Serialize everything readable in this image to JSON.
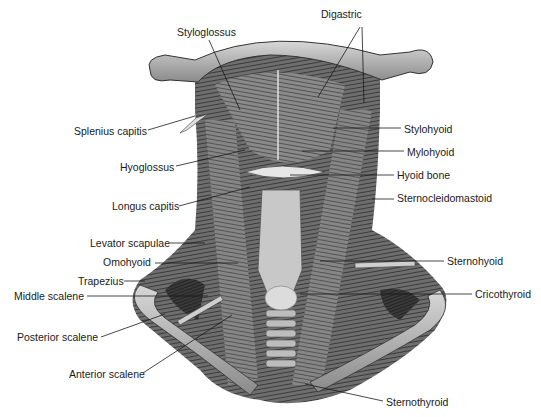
{
  "figure": {
    "labels": [
      {
        "id": "digastric",
        "text": "Digastric",
        "x": 321,
        "y": 8
      },
      {
        "id": "styloglossus",
        "text": "Styloglossus",
        "x": 177,
        "y": 26
      },
      {
        "id": "splenius-capitis",
        "text": "Splenius capitis",
        "x": 74,
        "y": 125
      },
      {
        "id": "stylohyoid",
        "text": "Stylohyoid",
        "x": 404,
        "y": 123
      },
      {
        "id": "hyoglossus",
        "text": "Hyoglossus",
        "x": 120,
        "y": 161
      },
      {
        "id": "mylohyoid",
        "text": "Mylohyoid",
        "x": 407,
        "y": 146
      },
      {
        "id": "hyoid-bone",
        "text": "Hyoid bone",
        "x": 397,
        "y": 169
      },
      {
        "id": "longus-capitis",
        "text": "Longus capitis",
        "x": 112,
        "y": 200
      },
      {
        "id": "sternocleidomastoid",
        "text": "Sternocleidomastoid",
        "x": 397,
        "y": 192
      },
      {
        "id": "levator-scapulae",
        "text": "Levator scapulae",
        "x": 90,
        "y": 237
      },
      {
        "id": "omohyoid",
        "text": "Omohyoid",
        "x": 103,
        "y": 256
      },
      {
        "id": "sternohyoid",
        "text": "Sternohyoid",
        "x": 447,
        "y": 255
      },
      {
        "id": "trapezius",
        "text": "Trapezius",
        "x": 78,
        "y": 275
      },
      {
        "id": "middle-scalene",
        "text": "Middle scalene",
        "x": 14,
        "y": 290
      },
      {
        "id": "cricothyroid",
        "text": "Cricothyroid",
        "x": 475,
        "y": 288
      },
      {
        "id": "posterior-scalene",
        "text": "Posterior scalene",
        "x": 17,
        "y": 331
      },
      {
        "id": "anterior-scalene",
        "text": "Anterior scalene",
        "x": 69,
        "y": 368
      },
      {
        "id": "sternothyroid",
        "text": "Sternothyroid",
        "x": 386,
        "y": 396
      }
    ],
    "leaders": [
      {
        "id": "digastric-a",
        "x1": 360,
        "y1": 27,
        "x2": 318,
        "y2": 97
      },
      {
        "id": "digastric-b",
        "x1": 362,
        "y1": 27,
        "x2": 364,
        "y2": 103
      },
      {
        "id": "styloglossus",
        "x1": 209,
        "y1": 40,
        "x2": 240,
        "y2": 110
      },
      {
        "id": "splenius-capitis",
        "x1": 148,
        "y1": 130,
        "x2": 195,
        "y2": 116
      },
      {
        "id": "stylohyoid",
        "x1": 401,
        "y1": 128,
        "x2": 333,
        "y2": 128
      },
      {
        "id": "hyoglossus",
        "x1": 176,
        "y1": 166,
        "x2": 245,
        "y2": 150
      },
      {
        "id": "mylohyoid",
        "x1": 404,
        "y1": 151,
        "x2": 302,
        "y2": 151
      },
      {
        "id": "hyoid-bone",
        "x1": 394,
        "y1": 175,
        "x2": 290,
        "y2": 175
      },
      {
        "id": "longus-capitis",
        "x1": 179,
        "y1": 206,
        "x2": 250,
        "y2": 187
      },
      {
        "id": "sternocleidomastoid",
        "x1": 394,
        "y1": 199,
        "x2": 372,
        "y2": 199
      },
      {
        "id": "levator-scapulae",
        "x1": 170,
        "y1": 243,
        "x2": 205,
        "y2": 243
      },
      {
        "id": "omohyoid",
        "x1": 155,
        "y1": 263,
        "x2": 238,
        "y2": 263
      },
      {
        "id": "sternohyoid",
        "x1": 444,
        "y1": 261,
        "x2": 320,
        "y2": 261
      },
      {
        "id": "trapezius",
        "x1": 124,
        "y1": 281,
        "x2": 145,
        "y2": 281
      },
      {
        "id": "middle-scalene",
        "x1": 87,
        "y1": 296,
        "x2": 208,
        "y2": 296
      },
      {
        "id": "cricothyroid",
        "x1": 472,
        "y1": 294,
        "x2": 300,
        "y2": 294
      },
      {
        "id": "posterior-scalene",
        "x1": 101,
        "y1": 337,
        "x2": 165,
        "y2": 314
      },
      {
        "id": "anterior-scalene",
        "x1": 143,
        "y1": 373,
        "x2": 232,
        "y2": 315
      },
      {
        "id": "sternothyroid",
        "x1": 383,
        "y1": 401,
        "x2": 305,
        "y2": 384
      }
    ]
  }
}
